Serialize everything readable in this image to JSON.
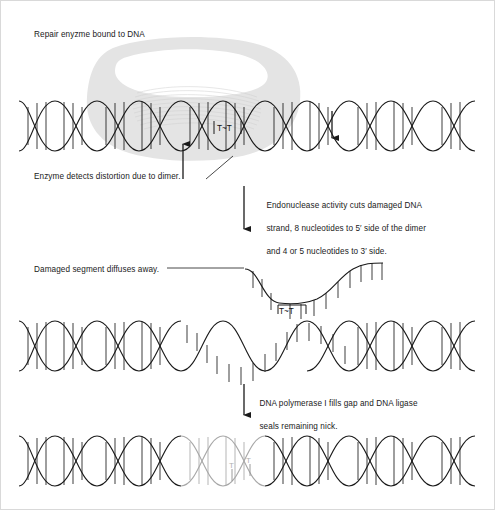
{
  "figure": {
    "background_color": "#ffffff",
    "ink_color": "#1a1a1a",
    "enzyme_color": "#e2e2e2",
    "repaired_strand_color": "#a8a8a8"
  },
  "steps": {
    "step1_title": "Repair enyzme bound to DNA",
    "step1_detect": "Enzyme detects distortion due to dimer.",
    "step2_endonuclease_line1": "Endonuclease activity cuts damaged DNA",
    "step2_endonuclease_line2": "strand, 8 nucleotides to 5′ side of the dimer",
    "step2_endonuclease_line3": "and 4 or 5 nucleotides to 3′ side.",
    "step3_diffuse": "Damaged segment diffuses away.",
    "step4_polymerase_line1": "DNA polymerase I fills gap and DNA ligase",
    "step4_polymerase_line2": "seals remaining nick."
  },
  "labels": {
    "dimer_top": "T~T",
    "dimer_excised": "T~T",
    "dimer_repaired_left": "T",
    "dimer_repaired_right": "T"
  },
  "icons": {
    "cut_site_5prime": "up-arrow-icon",
    "cut_site_3prime": "down-arrow-icon",
    "process_arrow_1": "down-arrow-icon",
    "process_arrow_2": "down-arrow-icon",
    "leader_line": "leader-line-icon"
  },
  "panels": [
    {
      "name": "panel-enzyme-bound",
      "y": 95,
      "description": "Double helix with repair enzyme clamp and thymine dimer"
    },
    {
      "name": "panel-excised",
      "y": 255,
      "description": "Damaged single strand excised and diffusing away, gap in helix"
    },
    {
      "name": "panel-repaired",
      "y": 425,
      "description": "Helix with newly synthesized gray segment filling the gap"
    }
  ]
}
